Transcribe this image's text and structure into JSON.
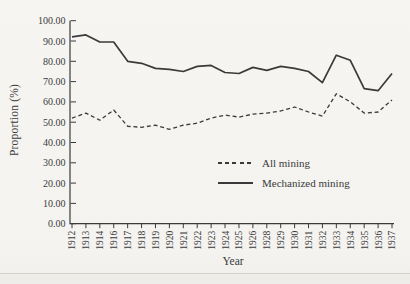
{
  "page": {
    "background_color": "#f5f4f1",
    "ink_color": "#3a3a3a"
  },
  "chart_data": {
    "type": "line",
    "title": "",
    "xlabel": "Year",
    "ylabel": "Proportion (%)",
    "ylim": [
      0,
      100
    ],
    "grid": false,
    "legend_position": "inside-lower-right",
    "yticks": [
      {
        "value": 100,
        "label": "100.00"
      },
      {
        "value": 90,
        "label": "90.00"
      },
      {
        "value": 80,
        "label": "80.00"
      },
      {
        "value": 70,
        "label": "70.00"
      },
      {
        "value": 60,
        "label": "60.00"
      },
      {
        "value": 50,
        "label": "50.00"
      },
      {
        "value": 40,
        "label": "40.00"
      },
      {
        "value": 30,
        "label": "30.00"
      },
      {
        "value": 20,
        "label": "20.00"
      },
      {
        "value": 10,
        "label": "10.00"
      },
      {
        "value": 0,
        "label": "0.00"
      }
    ],
    "categories": [
      "1912",
      "1913",
      "1914",
      "1916",
      "1917",
      "1918",
      "1919",
      "1920",
      "1921",
      "1922",
      "1923",
      "1924",
      "1925",
      "1926",
      "1928",
      "1929",
      "1930",
      "1931",
      "1932",
      "1933",
      "1934",
      "1935",
      "1936",
      "1937"
    ],
    "series": [
      {
        "name": "All mining",
        "style": "dashed",
        "values": [
          52,
          54.5,
          51,
          56,
          48,
          47.5,
          48.5,
          46.5,
          48.5,
          49.5,
          52,
          53.5,
          52.5,
          54,
          54.5,
          55.5,
          57.5,
          55,
          53,
          64,
          60,
          54.5,
          55,
          61
        ]
      },
      {
        "name": "Mechanized mining",
        "style": "solid",
        "values": [
          92,
          93,
          89.5,
          89.5,
          80,
          79,
          76.5,
          76,
          75,
          77.5,
          78,
          74.5,
          74,
          77,
          75.5,
          77.5,
          76.5,
          75,
          69.5,
          83,
          80.5,
          66.5,
          65.5,
          74
        ]
      }
    ]
  }
}
